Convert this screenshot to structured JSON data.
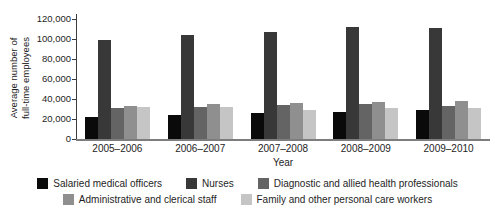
{
  "chart_data": {
    "type": "bar",
    "title": "",
    "xlabel": "Year",
    "ylabel": "Average number of full-time employees",
    "ylabel_lines": [
      "Average number of",
      "full-time employees"
    ],
    "ylim": [
      0,
      120000
    ],
    "ytick_labels": [
      "0",
      "20,000",
      "40,000",
      "60,000",
      "80,000",
      "100,000",
      "120,000"
    ],
    "grid": false,
    "legend_position": "bottom",
    "categories": [
      "2005–2006",
      "2006–2007",
      "2007–2008",
      "2008–2009",
      "2009–2010"
    ],
    "series": [
      {
        "name": "Salaried medical officers",
        "color": "#0a0a0a",
        "values": [
          22000,
          24000,
          26000,
          27500,
          29500
        ]
      },
      {
        "name": "Nurses",
        "color": "#383838",
        "values": [
          99500,
          104000,
          107500,
          112000,
          111000
        ]
      },
      {
        "name": "Diagnostic and allied health professionals",
        "color": "#646464",
        "values": [
          31500,
          32500,
          34500,
          35000,
          33000
        ]
      },
      {
        "name": "Administrative and clerical staff",
        "color": "#8f8f8f",
        "values": [
          33500,
          35500,
          36500,
          37500,
          38000
        ]
      },
      {
        "name": "Family and other personal care workers",
        "color": "#c5c5c5",
        "values": [
          32500,
          32000,
          29500,
          31500,
          31000
        ]
      }
    ],
    "axis_color": "#3c3c3c",
    "baseline_color": "#7d7d7d"
  }
}
